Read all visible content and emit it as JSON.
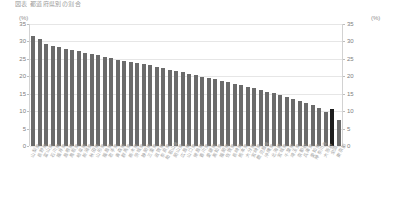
{
  "chart_title": "図表 都道府県別の割合",
  "axis": {
    "left_unit": "(%)",
    "right_unit": "(%)",
    "ticks": [
      "35",
      "30",
      "25",
      "20",
      "15",
      "10",
      "5",
      "0"
    ]
  },
  "chart_data": {
    "type": "bar",
    "title": "図表 都道府県別の割合",
    "xlabel": "",
    "ylabel": "(%)",
    "ylim": [
      0,
      35
    ],
    "ytick_step": 5,
    "grid": true,
    "legend": "none",
    "sorted": "descending",
    "bar_color": "#6b6b6b",
    "highlight_color": "#1d1d1d",
    "highlight_index": 46,
    "categories": [
      "山梨県",
      "長野県",
      "富山県",
      "石川県",
      "福井県",
      "島根県",
      "鳥取県",
      "岐阜県",
      "新潟県",
      "秋田県",
      "山形県",
      "福島県",
      "岩手県",
      "青森県",
      "群馬県",
      "栃木県",
      "茨城県",
      "静岡県",
      "三重県",
      "滋賀県",
      "奈良県",
      "和歌山県",
      "岡山県",
      "広島県",
      "山口県",
      "徳島県",
      "香川県",
      "愛媛県",
      "高知県",
      "福岡県",
      "佐賀県",
      "長崎県",
      "熊本県",
      "大分県",
      "宮崎県",
      "鹿児島県",
      "沖縄県",
      "北海道",
      "宮城県",
      "千葉県",
      "埼玉県",
      "京都府",
      "兵庫県",
      "愛知県",
      "神奈川県",
      "大阪府",
      "全国",
      "東京都"
    ],
    "values": [
      31.5,
      30.7,
      29.2,
      28.6,
      28.3,
      27.9,
      27.6,
      27.2,
      26.6,
      26.3,
      26.0,
      25.6,
      25.2,
      24.8,
      24.4,
      24.1,
      23.8,
      23.4,
      23.1,
      22.7,
      22.3,
      21.9,
      21.5,
      21.1,
      20.7,
      20.3,
      19.9,
      19.5,
      19.1,
      18.7,
      18.3,
      17.9,
      17.5,
      17.0,
      16.6,
      16.1,
      15.6,
      15.1,
      14.6,
      14.1,
      13.5,
      13.0,
      12.4,
      11.8,
      11.0,
      9.8,
      10.6,
      7.6
    ]
  }
}
